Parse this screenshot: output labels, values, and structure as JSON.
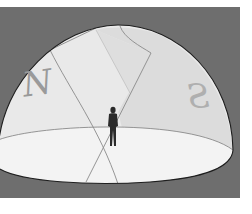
{
  "diagram": {
    "type": "celestial-sphere-illustration",
    "labels": {
      "north": "N",
      "south": "S"
    },
    "colors": {
      "background": "#ffffff",
      "panel": "#6e6e6e",
      "dome": "#e9e9e9",
      "dome_shade": "#d6d6d6",
      "ground_plane": "#f2f2f2",
      "outline": "#1e1e1e",
      "grid_lines": "#8a8a8a",
      "letters": "#9a9a9a",
      "person": "#2a2a2a"
    },
    "elements": [
      "sky dome hemisphere",
      "horizon plane ellipse",
      "meridian great-circle bands",
      "observer figure at center"
    ]
  }
}
